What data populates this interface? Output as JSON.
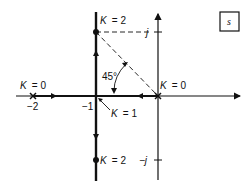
{
  "diagram": {
    "type": "root-locus",
    "plane_label": "s",
    "colors": {
      "ink": "#111111",
      "background": "#ffffff"
    },
    "real_axis": {
      "ticks": [
        {
          "value": -2,
          "label": "−2"
        },
        {
          "value": -1,
          "label": "−1"
        }
      ]
    },
    "imag_axis": {
      "ticks": [
        {
          "value": 1,
          "label": "j"
        },
        {
          "value": -1,
          "label": "−j"
        }
      ]
    },
    "poles": [
      {
        "position": -2,
        "label": "K = 0"
      },
      {
        "position": 0,
        "label": "K = 0"
      }
    ],
    "breakaway": {
      "position": -1,
      "label": "K = 1"
    },
    "gain_points": [
      {
        "position": "-1 + j",
        "label": "K = 2"
      },
      {
        "position": "-1 - j",
        "label": "K = 2"
      }
    ],
    "angle": {
      "label": "45°"
    }
  }
}
